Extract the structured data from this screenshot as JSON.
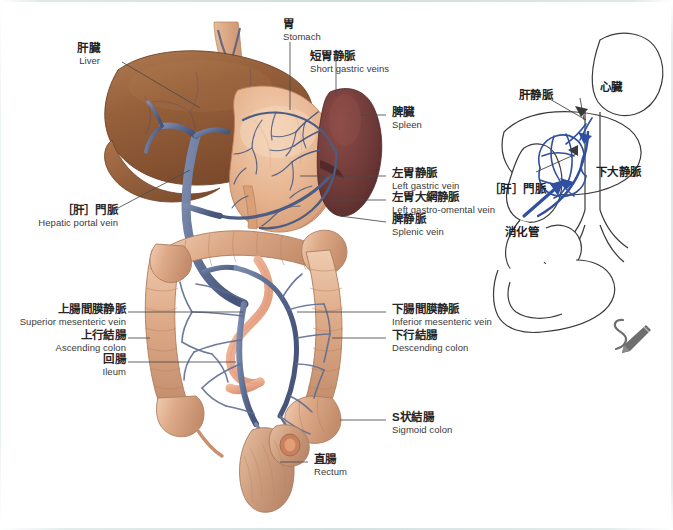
{
  "page": {
    "background_color": "#ffffff",
    "width": 673,
    "height": 530
  },
  "palette": {
    "liver": "#8C5A37",
    "liver_light": "#A87049",
    "stomach": "#E0A883",
    "stomach_light": "#EFC6A6",
    "spleen": "#6E3A38",
    "spleen_light": "#8A4A46",
    "colon": "#D9A383",
    "colon_light": "#EBC3A6",
    "small_intestine": "#E9A98A",
    "vein": "#5E6E93",
    "vein_dark": "#47557A",
    "schematic_line": "#3a3a3a",
    "schematic_vein": "#2F4FA0",
    "label_text": "#262626",
    "leader_line": "#4a4a4a",
    "pencil_icon": "#6e6e6e"
  },
  "main_diagram": {
    "labels": [
      {
        "id": "liver",
        "jp": "肝臓",
        "en": "Liver"
      },
      {
        "id": "stomach",
        "jp": "胃",
        "en": "Stomach"
      },
      {
        "id": "short-gastric",
        "jp": "短胃静脈",
        "en": "Short gastric veins"
      },
      {
        "id": "spleen",
        "jp": "脾臓",
        "en": "Spleen"
      },
      {
        "id": "left-gastric",
        "jp": "左胃静脈",
        "en": "Left gastric vein"
      },
      {
        "id": "left-gastro-omental",
        "jp": "左胃大網静脈",
        "en": "Left gastro-omental vein"
      },
      {
        "id": "splenic-vein",
        "jp": "脾静脈",
        "en": "Splenic vein"
      },
      {
        "id": "hepatic-portal-vein",
        "jp": "［肝］門脈",
        "en": "Hepatic portal vein"
      },
      {
        "id": "superior-mesenteric-vein",
        "jp": "上腸間膜静脈",
        "en": "Superior mesenteric vein"
      },
      {
        "id": "ascending-colon",
        "jp": "上行結腸",
        "en": "Ascending colon"
      },
      {
        "id": "ileum",
        "jp": "回腸",
        "en": "Ileum"
      },
      {
        "id": "inferior-mesenteric-vein",
        "jp": "下腸間膜静脈",
        "en": "Inferior mesenteric vein"
      },
      {
        "id": "descending-colon",
        "jp": "下行結腸",
        "en": "Descending colon"
      },
      {
        "id": "sigmoid-colon",
        "jp": "S状結腸",
        "en": "Sigmoid colon"
      },
      {
        "id": "rectum",
        "jp": "直腸",
        "en": "Rectum"
      }
    ]
  },
  "schematic_diagram": {
    "labels": [
      {
        "id": "hepatic-vein",
        "jp": "肝静脈"
      },
      {
        "id": "heart",
        "jp": "心臓"
      },
      {
        "id": "inferior-vena-cava",
        "jp": "下大静脈"
      },
      {
        "id": "portal-vein",
        "jp": "［肝］門脈"
      },
      {
        "id": "digestive-tract",
        "jp": "消化管"
      }
    ]
  },
  "icons": {
    "pencil": {
      "name": "pencil-icon",
      "glyph": "✎",
      "color": "#6e6e6e"
    }
  }
}
